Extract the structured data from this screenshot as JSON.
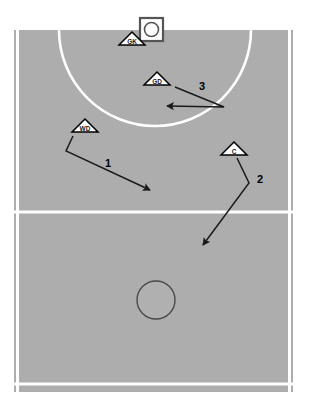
{
  "diagram": {
    "canvas": {
      "width": 309,
      "height": 407
    }
  },
  "colors": {
    "page_background": "#ffffff",
    "court_surface": "#adadad",
    "court_line": "#ffffff",
    "marker_fill": "#ffffff",
    "marker_stroke": "#000000",
    "arrow_stroke": "#1a1a1a",
    "centre_circle_stroke": "#4a4a4a",
    "goal_post_stroke": "#555555",
    "label_text": "#1a1a1a"
  },
  "court": {
    "surface_name": "netball-court-surface",
    "x": 14,
    "y": 30,
    "width": 279,
    "height": 362,
    "left_sideline": {
      "x": 17,
      "y1": 30,
      "y2": 392
    },
    "right_sideline": {
      "x": 290,
      "y1": 30,
      "y2": 392
    },
    "transverse_line": {
      "y": 212,
      "x1": 14,
      "x2": 293
    },
    "bottom_line": {
      "y": 384,
      "x1": 14,
      "x2": 293
    },
    "goal_circle": {
      "cx": 155,
      "cy": 30,
      "r": 96
    },
    "centre_circle": {
      "cx": 156,
      "cy": 300,
      "r": 19
    },
    "goal_post": {
      "x": 140,
      "y": 18,
      "size": 23,
      "ring_r": 7
    }
  },
  "players": [
    {
      "name": "player-marker-gk",
      "label": "GK",
      "position_name": "Goal Keeper",
      "x": 132,
      "y": 45,
      "size": 13
    },
    {
      "name": "player-marker-gd",
      "label": "GD",
      "position_name": "Goal Defence",
      "x": 157,
      "y": 85,
      "size": 13
    },
    {
      "name": "player-marker-wd",
      "label": "WD",
      "position_name": "Wing Defence",
      "x": 85,
      "y": 132,
      "size": 13
    },
    {
      "name": "player-marker-c",
      "label": "C",
      "position_name": "Centre",
      "x": 234,
      "y": 155,
      "size": 13
    }
  ],
  "movements": [
    {
      "name": "movement-arrow-1",
      "number": "1",
      "from_player": "WD",
      "path": "M 73,136 L 66,151 L 150,190",
      "label_x": 108,
      "label_y": 167
    },
    {
      "name": "movement-arrow-2",
      "number": "2",
      "from_player": "C",
      "path": "M 237,158 L 249,183 L 203,245",
      "label_x": 260,
      "label_y": 183
    },
    {
      "name": "movement-arrow-3",
      "number": "3",
      "from_player": "GD",
      "path": "M 175,87 L 224,107 L 167,106",
      "label_x": 202,
      "label_y": 90
    }
  ]
}
